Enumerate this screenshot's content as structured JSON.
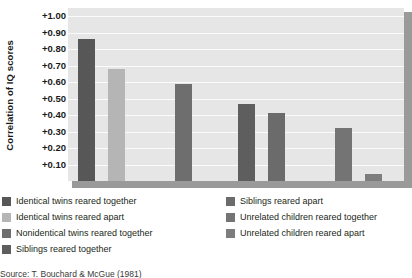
{
  "chart_data": {
    "type": "bar",
    "title": "",
    "xlabel": "",
    "ylabel": "Correlation of IQ scores",
    "ylim": [
      0.0,
      1.05
    ],
    "grid": true,
    "legend_position": "bottom",
    "tick_labels": [
      "+1.00",
      "+0.90",
      "+0.80",
      "+0.70",
      "+0.60",
      "+0.50",
      "+0.40",
      "+0.30",
      "+0.20",
      "+0.10"
    ],
    "tick_values": [
      1.0,
      0.9,
      0.8,
      0.7,
      0.6,
      0.5,
      0.4,
      0.3,
      0.2,
      0.1
    ],
    "categories": [
      "Identical twins reared together",
      "Identical twins reared apart",
      "Nonidentical twins reared together",
      "Siblings reared together",
      "Siblings reared apart",
      "Unrelated children reared together",
      "Unrelated children reared apart"
    ],
    "values": [
      0.86,
      0.68,
      0.59,
      0.47,
      0.41,
      0.32,
      0.04
    ],
    "bar_colors": [
      "#575757",
      "#b5b5b5",
      "#6e6e6e",
      "#5e5e5e",
      "#6b6b6b",
      "#747474",
      "#7d7d7d"
    ],
    "plot_background": "#e6e6e6",
    "gridline_color": "#fbfbfb",
    "source": "Source: T. Bouchard & McGue (1981)"
  },
  "legend": {
    "left_column": [
      {
        "label": "Identical twins reared together",
        "color": "#575757"
      },
      {
        "label": "Identical twins reared apart",
        "color": "#b5b5b5"
      },
      {
        "label": "Nonidentical twins reared together",
        "color": "#6e6e6e"
      },
      {
        "label": "Siblings reared together",
        "color": "#5e5e5e"
      }
    ],
    "right_column": [
      {
        "label": "Siblings reared apart",
        "color": "#6b6b6b"
      },
      {
        "label": "Unrelated children reared together",
        "color": "#747474"
      },
      {
        "label": "Unrelated children reared apart",
        "color": "#7d7d7d"
      }
    ]
  },
  "source_line": "Source: T. Bouchard & McGue (1981)"
}
